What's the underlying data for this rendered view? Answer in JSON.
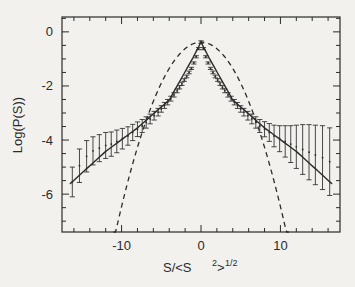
{
  "figure": {
    "background_color": "#f2f1ee",
    "ink_color": "#2b2b2b",
    "axis_label_x_main": "S/<S",
    "axis_label_x_exp": "2",
    "axis_label_x_close": ">",
    "axis_label_x_power": "1/2",
    "axis_label_y": "Log(P(S))"
  },
  "chart_data": {
    "type": "line",
    "title": "",
    "xlabel": "S/<S^2>^1/2",
    "ylabel": "Log(P(S))",
    "xlim": [
      -17.5,
      17.5
    ],
    "ylim": [
      -7.4,
      0.55
    ],
    "grid": false,
    "legend": "none",
    "xticks": [
      -10,
      0,
      10
    ],
    "xtick_labels": [
      "-10",
      "0",
      "10"
    ],
    "yticks": [
      0,
      -2,
      -4,
      -6
    ],
    "ytick_labels": [
      "0",
      "-2",
      "-4",
      "-6"
    ],
    "xminor_step": 2,
    "yminor_step": 0.5,
    "series": [
      {
        "name": "data-points-with-errorbars",
        "style": "errorbar",
        "x": [
          -16.2,
          -15.3,
          -14.4,
          -13.6,
          -12.8,
          -12.0,
          -11.3,
          -10.6,
          -9.9,
          -9.2,
          -8.6,
          -8.0,
          -7.4,
          -6.9,
          -6.4,
          -5.9,
          -5.4,
          -5.0,
          -4.6,
          -4.2,
          -3.8,
          -3.4,
          -3.0,
          -2.7,
          -2.4,
          -2.1,
          -1.8,
          -1.5,
          -1.2,
          -0.9,
          -0.6,
          -0.3,
          0.0,
          0.3,
          0.6,
          0.9,
          1.2,
          1.5,
          1.8,
          2.1,
          2.4,
          2.7,
          3.0,
          3.4,
          3.8,
          4.2,
          4.6,
          5.0,
          5.4,
          5.9,
          6.4,
          6.9,
          7.4,
          8.0,
          8.6,
          9.2,
          9.9,
          10.6,
          11.3,
          12.0,
          12.8,
          13.6,
          14.4,
          15.3,
          16.2
        ],
        "y": [
          -5.55,
          -4.95,
          -4.6,
          -4.4,
          -4.3,
          -4.2,
          -4.15,
          -4.05,
          -3.95,
          -3.85,
          -3.72,
          -3.6,
          -3.48,
          -3.35,
          -3.22,
          -3.1,
          -2.97,
          -2.85,
          -2.72,
          -2.6,
          -2.47,
          -2.33,
          -2.18,
          -2.05,
          -1.92,
          -1.78,
          -1.65,
          -1.5,
          -1.35,
          -1.15,
          -0.92,
          -0.62,
          -0.38,
          -0.62,
          -0.92,
          -1.15,
          -1.35,
          -1.5,
          -1.65,
          -1.78,
          -1.92,
          -2.05,
          -2.18,
          -2.33,
          -2.47,
          -2.6,
          -2.72,
          -2.85,
          -2.97,
          -3.1,
          -3.22,
          -3.35,
          -3.48,
          -3.6,
          -3.72,
          -3.85,
          -3.95,
          -4.05,
          -4.15,
          -4.25,
          -4.35,
          -4.45,
          -4.55,
          -4.65,
          -4.8
        ],
        "yerr": [
          0.55,
          0.62,
          0.58,
          0.52,
          0.5,
          0.48,
          0.45,
          0.42,
          0.38,
          0.34,
          0.3,
          0.27,
          0.24,
          0.21,
          0.18,
          0.16,
          0.14,
          0.12,
          0.11,
          0.1,
          0.09,
          0.08,
          0.07,
          0.06,
          0.06,
          0.05,
          0.05,
          0.05,
          0.04,
          0.04,
          0.04,
          0.04,
          0.05,
          0.04,
          0.04,
          0.04,
          0.04,
          0.05,
          0.05,
          0.05,
          0.06,
          0.06,
          0.07,
          0.08,
          0.09,
          0.1,
          0.11,
          0.12,
          0.14,
          0.16,
          0.18,
          0.21,
          0.24,
          0.28,
          0.33,
          0.4,
          0.48,
          0.58,
          0.68,
          0.8,
          0.92,
          1.02,
          1.1,
          1.18,
          1.25
        ]
      },
      {
        "name": "exponential-fit",
        "style": "solid",
        "description": "solid tent-shaped fit line through the data",
        "x": [
          -16.5,
          -12.0,
          -8.0,
          -4.0,
          -1.0,
          0.0,
          1.0,
          4.0,
          8.0,
          12.0,
          16.5
        ],
        "y": [
          -5.62,
          -4.42,
          -3.55,
          -2.52,
          -0.95,
          -0.38,
          -0.95,
          -2.52,
          -3.55,
          -4.42,
          -5.62
        ]
      },
      {
        "name": "gaussian-reference",
        "style": "dashed",
        "description": "dashed inverted parabola, a Gaussian on log scale",
        "x": [
          -10.2,
          -9.0,
          -7.0,
          -5.0,
          -3.0,
          -1.0,
          0.0,
          1.0,
          3.0,
          5.0,
          7.0,
          9.0,
          10.2
        ],
        "y": [
          -7.3,
          -5.75,
          -3.55,
          -1.9,
          -0.85,
          -0.42,
          -0.38,
          -0.42,
          -0.85,
          -1.9,
          -3.55,
          -5.75,
          -7.3
        ]
      }
    ]
  }
}
